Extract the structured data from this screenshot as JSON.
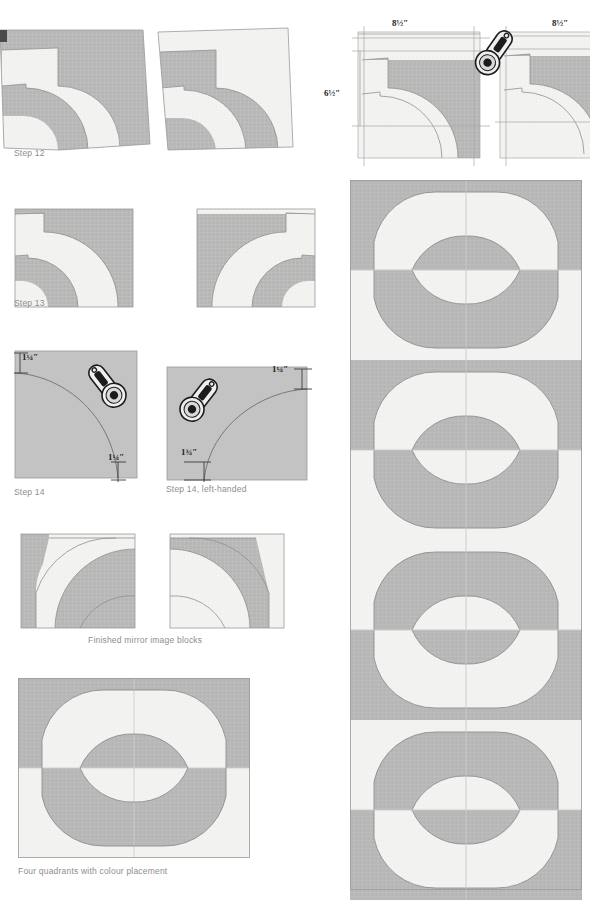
{
  "page": {
    "background": "#ffffff"
  },
  "palette": {
    "fabric_dark": "#b6b6b6",
    "fabric_light": "#f3f3f1",
    "outline": "#8f8f8f",
    "grid_line": "#e2e2de",
    "caption_text": "#8e8e8e",
    "dim_text": "#262626",
    "guide_line": "#b0b0b0",
    "tool_body": "#efefef",
    "tool_outline": "#1c1c1c"
  },
  "steps": [
    {
      "id": "step-12",
      "caption": "Step 12",
      "blocks": 2,
      "description": "Two pieced curved blocks with untrimmed edges"
    },
    {
      "id": "step-12-trim",
      "caption": "",
      "dimensions": [
        {
          "id": "width-left",
          "value": "8½″",
          "orientation": "horizontal"
        },
        {
          "id": "height-left",
          "value": "6½″",
          "orientation": "vertical"
        },
        {
          "id": "width-right",
          "value": "8½″",
          "orientation": "horizontal"
        }
      ],
      "tool": "rotary-cutter",
      "description": "Trimming blocks to size with rotary cutter"
    },
    {
      "id": "step-13",
      "caption": "Step 13",
      "blocks": 2,
      "description": "Two trimmed mirror-image curved blocks"
    },
    {
      "id": "step-14",
      "caption": "Step 14",
      "dimensions": [
        {
          "id": "top-left-inset",
          "value": "1¼″",
          "orientation": "vertical"
        },
        {
          "id": "bottom-right-inset",
          "value": "1¼″",
          "orientation": "vertical"
        }
      ],
      "tool": "rotary-cutter",
      "description": "Marking and cutting the inner curve, right-handed"
    },
    {
      "id": "step-14-left-handed",
      "caption": "Step 14, left-handed",
      "dimensions": [
        {
          "id": "top-right-inset",
          "value": "1¼″",
          "orientation": "vertical"
        },
        {
          "id": "bottom-left-inset",
          "value": "1¾″",
          "orientation": "vertical"
        }
      ],
      "tool": "rotary-cutter",
      "description": "Marking and cutting the inner curve, left-handed"
    },
    {
      "id": "finished-blocks",
      "caption": "Finished mirror image blocks",
      "blocks": 2,
      "description": "Pair of completed mirror-image blocks"
    },
    {
      "id": "four-quadrants",
      "caption": "Four quadrants with colour placement",
      "blocks": 4,
      "description": "Four blocks joined forming a double ring motif"
    }
  ],
  "quilt_panel": {
    "id": "quilt-strip",
    "columns": 2,
    "ring_motifs": 4,
    "description": "Vertical strip of joined ring motifs showing the repeating quilt layout"
  }
}
